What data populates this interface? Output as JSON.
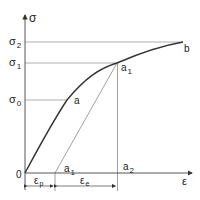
{
  "diagram": {
    "type": "stress-strain curve",
    "axes": {
      "y_label": "σ",
      "x_label": "ε",
      "origin_label": "0"
    },
    "stress_levels": [
      {
        "symbol": "σ",
        "sub": "2",
        "y": 42
      },
      {
        "symbol": "σ",
        "sub": "1",
        "y": 63
      },
      {
        "symbol": "σ",
        "sub": "0",
        "y": 100
      }
    ],
    "points": {
      "a": {
        "label": "a",
        "sub": ""
      },
      "a1_upper": {
        "label": "a",
        "sub": "1"
      },
      "a1_lower": {
        "label": "a",
        "sub": "1"
      },
      "a2": {
        "label": "a",
        "sub": "2"
      },
      "b": {
        "label": "b",
        "sub": ""
      }
    },
    "strain_segments": {
      "plastic": {
        "symbol": "ε",
        "sub": "p"
      },
      "elastic": {
        "symbol": "ε",
        "sub": "e"
      }
    },
    "colors": {
      "curve": "#333333",
      "guide": "#888888",
      "axis": "#444444",
      "text": "#222222"
    }
  }
}
